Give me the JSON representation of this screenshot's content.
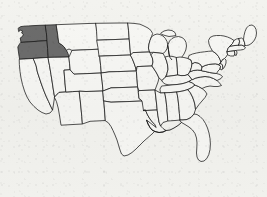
{
  "figure": {
    "name": "united-states-choropleth",
    "width": 267,
    "height": 197,
    "background_color": "#f7f7f5"
  },
  "legend": {
    "highlight_color": "#6e6e6e",
    "plain_color": "#fbfbfa",
    "border_color": "#1a1a1a"
  },
  "map": {
    "projection_note": "contiguous-48",
    "highlighted_states": [
      "Washington",
      "Oregon",
      "Idaho"
    ],
    "states": [
      {
        "code": "WA",
        "name": "Washington",
        "highlighted": true
      },
      {
        "code": "OR",
        "name": "Oregon",
        "highlighted": true
      },
      {
        "code": "ID",
        "name": "Idaho",
        "highlighted": true
      },
      {
        "code": "CA",
        "name": "California",
        "highlighted": false
      },
      {
        "code": "NV",
        "name": "Nevada",
        "highlighted": false
      },
      {
        "code": "UT",
        "name": "Utah",
        "highlighted": false
      },
      {
        "code": "AZ",
        "name": "Arizona",
        "highlighted": false
      },
      {
        "code": "MT",
        "name": "Montana",
        "highlighted": false
      },
      {
        "code": "WY",
        "name": "Wyoming",
        "highlighted": false
      },
      {
        "code": "CO",
        "name": "Colorado",
        "highlighted": false
      },
      {
        "code": "NM",
        "name": "New Mexico",
        "highlighted": false
      },
      {
        "code": "ND",
        "name": "North Dakota",
        "highlighted": false
      },
      {
        "code": "SD",
        "name": "South Dakota",
        "highlighted": false
      },
      {
        "code": "NE",
        "name": "Nebraska",
        "highlighted": false
      },
      {
        "code": "KS",
        "name": "Kansas",
        "highlighted": false
      },
      {
        "code": "OK",
        "name": "Oklahoma",
        "highlighted": false
      },
      {
        "code": "TX",
        "name": "Texas",
        "highlighted": false
      },
      {
        "code": "MN",
        "name": "Minnesota",
        "highlighted": false
      },
      {
        "code": "IA",
        "name": "Iowa",
        "highlighted": false
      },
      {
        "code": "MO",
        "name": "Missouri",
        "highlighted": false
      },
      {
        "code": "AR",
        "name": "Arkansas",
        "highlighted": false
      },
      {
        "code": "LA",
        "name": "Louisiana",
        "highlighted": false
      },
      {
        "code": "WI",
        "name": "Wisconsin",
        "highlighted": false
      },
      {
        "code": "IL",
        "name": "Illinois",
        "highlighted": false
      },
      {
        "code": "MI",
        "name": "Michigan",
        "highlighted": false
      },
      {
        "code": "IN",
        "name": "Indiana",
        "highlighted": false
      },
      {
        "code": "OH",
        "name": "Ohio",
        "highlighted": false
      },
      {
        "code": "KY",
        "name": "Kentucky",
        "highlighted": false
      },
      {
        "code": "TN",
        "name": "Tennessee",
        "highlighted": false
      },
      {
        "code": "MS",
        "name": "Mississippi",
        "highlighted": false
      },
      {
        "code": "AL",
        "name": "Alabama",
        "highlighted": false
      },
      {
        "code": "GA",
        "name": "Georgia",
        "highlighted": false
      },
      {
        "code": "FL",
        "name": "Florida",
        "highlighted": false
      },
      {
        "code": "SC",
        "name": "South Carolina",
        "highlighted": false
      },
      {
        "code": "NC",
        "name": "North Carolina",
        "highlighted": false
      },
      {
        "code": "VA",
        "name": "Virginia",
        "highlighted": false
      },
      {
        "code": "WV",
        "name": "West Virginia",
        "highlighted": false
      },
      {
        "code": "MD",
        "name": "Maryland",
        "highlighted": false
      },
      {
        "code": "DE",
        "name": "Delaware",
        "highlighted": false
      },
      {
        "code": "PA",
        "name": "Pennsylvania",
        "highlighted": false
      },
      {
        "code": "NJ",
        "name": "New Jersey",
        "highlighted": false
      },
      {
        "code": "NY",
        "name": "New York",
        "highlighted": false
      },
      {
        "code": "CT",
        "name": "Connecticut",
        "highlighted": false
      },
      {
        "code": "RI",
        "name": "Rhode Island",
        "highlighted": false
      },
      {
        "code": "MA",
        "name": "Massachusetts",
        "highlighted": false
      },
      {
        "code": "VT",
        "name": "Vermont",
        "highlighted": false
      },
      {
        "code": "NH",
        "name": "New Hampshire",
        "highlighted": false
      },
      {
        "code": "ME",
        "name": "Maine",
        "highlighted": false
      }
    ]
  }
}
